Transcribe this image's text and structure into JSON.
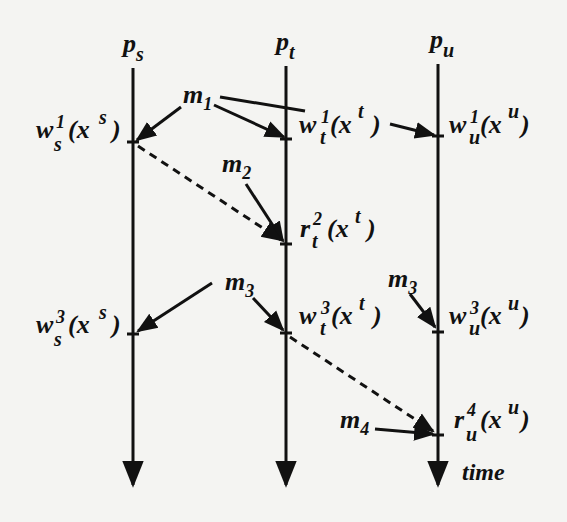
{
  "diagram": {
    "processes": [
      {
        "id": "ps",
        "base": "p",
        "sub": "s",
        "x": 133
      },
      {
        "id": "pt",
        "base": "p",
        "sub": "t",
        "x": 286
      },
      {
        "id": "pu",
        "base": "p",
        "sub": "u",
        "x": 438
      }
    ],
    "time_label": "time",
    "events": [
      {
        "id": "ws1",
        "op": "w",
        "sub": "s",
        "sup": "1",
        "arg": "(x",
        "argsup": "s",
        "close": ")"
      },
      {
        "id": "wt1",
        "op": "w",
        "sub": "t",
        "sup": "1",
        "arg": "(x",
        "argsup": "t",
        "close": ")"
      },
      {
        "id": "wu1",
        "op": "w",
        "sub": "u",
        "sup": "1",
        "arg": "(x",
        "argsup": "u",
        "close": ")"
      },
      {
        "id": "rt2",
        "op": "r",
        "sub": "t",
        "sup": "2",
        "arg": "(x",
        "argsup": "t",
        "close": ")"
      },
      {
        "id": "ws3",
        "op": "w",
        "sub": "s",
        "sup": "3",
        "arg": "(x",
        "argsup": "s",
        "close": ")"
      },
      {
        "id": "wt3",
        "op": "w",
        "sub": "t",
        "sup": "3",
        "arg": "(x",
        "argsup": "t",
        "close": ")"
      },
      {
        "id": "wu3",
        "op": "w",
        "sub": "u",
        "sup": "3",
        "arg": "(x",
        "argsup": "u",
        "close": ")"
      },
      {
        "id": "ru4",
        "op": "r",
        "sub": "u",
        "sup": "4",
        "arg": "(x",
        "argsup": "u",
        "close": ")"
      }
    ],
    "messages": [
      {
        "id": "m1",
        "base": "m",
        "sub": "1"
      },
      {
        "id": "m2",
        "base": "m",
        "sub": "2"
      },
      {
        "id": "m3a",
        "base": "m",
        "sub": "3"
      },
      {
        "id": "m3b",
        "base": "m",
        "sub": "3"
      },
      {
        "id": "m4",
        "base": "m",
        "sub": "4"
      }
    ],
    "colors": {
      "ink": "#111111",
      "background": "#f4f4f2"
    }
  }
}
